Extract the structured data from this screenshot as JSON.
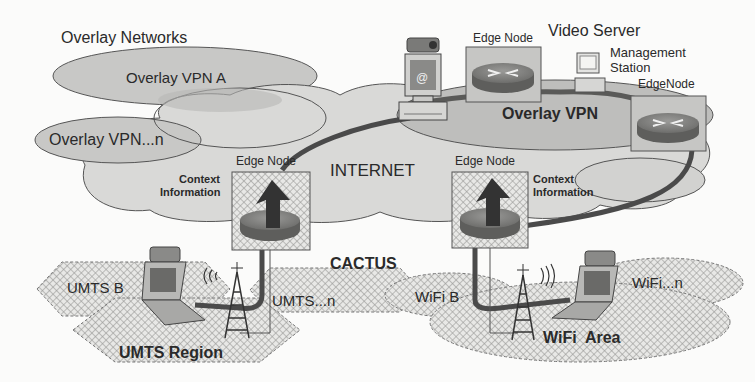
{
  "diagram": {
    "title": "Overlay Networks",
    "overlays": [
      {
        "label": "Overlay VPN A"
      },
      {
        "label": "Overlay VPN...n"
      }
    ],
    "overlay_vpn_label": "Overlay VPN",
    "internet_label": "INTERNET",
    "system_label": "CACTUS",
    "edge_nodes": {
      "top": "Edge Node",
      "right": "EdgeNode",
      "left_access": "Edge Node",
      "right_access": "Edge Node"
    },
    "context_info": {
      "left": [
        "Context",
        "Information"
      ],
      "right": [
        "Context",
        "Information"
      ]
    },
    "video_server_label": "Video Server",
    "management_station_label": [
      "Management",
      "Station"
    ],
    "umts": {
      "region_label": "UMTS Region",
      "b_label": "UMTS B",
      "n_label": "UMTS...n"
    },
    "wifi": {
      "area_label": "WiFi  Area",
      "b_label": "WiFi B",
      "n_label": "WiFi...n"
    },
    "colors": {
      "cloud_fill": "#d8d8d6",
      "overlay_fill": "#c4c4c2",
      "overlay_vpn_fill": "#bdbdbb",
      "stroke": "#3a3a3a",
      "link": "#4a4a4a",
      "router": "#7a7a7a"
    }
  }
}
